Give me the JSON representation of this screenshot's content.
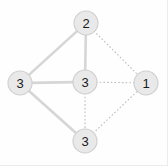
{
  "figure": {
    "name": "undirected-graph-diagram",
    "background_color": "#fefefe",
    "border_color": "#ececec",
    "width": 168,
    "height": 166
  },
  "style": {
    "node_fill": "#e9e9e9",
    "node_stroke": "#cfcfcf",
    "node_radius": 12,
    "label_color": "#1a1a1a",
    "solid_edge_color": "#d6d6d6",
    "dotted_edge_color": "#bdbdbd"
  },
  "chart_data": {
    "type": "diagram",
    "subtype": "node-link-graph",
    "title": "",
    "nodes": [
      {
        "id": "top",
        "label": "2",
        "x": 86,
        "y": 23,
        "r": 12
      },
      {
        "id": "left",
        "label": "3",
        "x": 20,
        "y": 83,
        "r": 12
      },
      {
        "id": "center",
        "label": "3",
        "x": 85,
        "y": 82,
        "r": 12
      },
      {
        "id": "right",
        "label": "1",
        "x": 146,
        "y": 83,
        "r": 12
      },
      {
        "id": "bottom",
        "label": "3",
        "x": 85,
        "y": 141,
        "r": 12
      }
    ],
    "edges": [
      {
        "from": "left",
        "to": "top",
        "style": "solid"
      },
      {
        "from": "left",
        "to": "center",
        "style": "solid"
      },
      {
        "from": "left",
        "to": "bottom",
        "style": "solid"
      },
      {
        "from": "top",
        "to": "center",
        "style": "solid"
      },
      {
        "from": "top",
        "to": "right",
        "style": "dotted"
      },
      {
        "from": "center",
        "to": "right",
        "style": "dotted"
      },
      {
        "from": "center",
        "to": "bottom",
        "style": "dotted"
      },
      {
        "from": "bottom",
        "to": "right",
        "style": "dotted"
      }
    ],
    "node_labels": [
      "2",
      "3",
      "3",
      "1",
      "3"
    ],
    "legend": [],
    "annotations": []
  }
}
